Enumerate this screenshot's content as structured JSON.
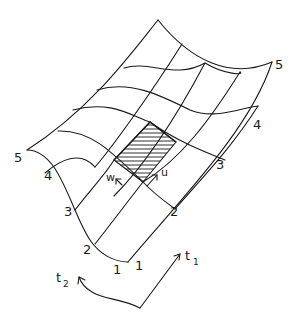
{
  "diagram": {
    "type": "parametric-surface-mesh",
    "stroke_color": "#1a1a1a",
    "background": "#ffffff",
    "edge_labels_t1_direction": [
      "1",
      "2",
      "3",
      "4",
      "5"
    ],
    "edge_labels_t2_direction": [
      "1",
      "2",
      "3",
      "4",
      "5"
    ],
    "vectors": {
      "u": "u",
      "w": "w"
    },
    "axes": {
      "t1": {
        "base": "t",
        "subscript": "1"
      },
      "t2": {
        "base": "t",
        "subscript": "2"
      }
    }
  },
  "labels": {
    "left_edge": {
      "l1": "1",
      "l2": "2",
      "l3": "3",
      "l4": "4",
      "l5": "5"
    },
    "right_edge": {
      "r1": "1",
      "r2": "2",
      "r3": "3",
      "r4": "4",
      "r5": "5"
    }
  }
}
